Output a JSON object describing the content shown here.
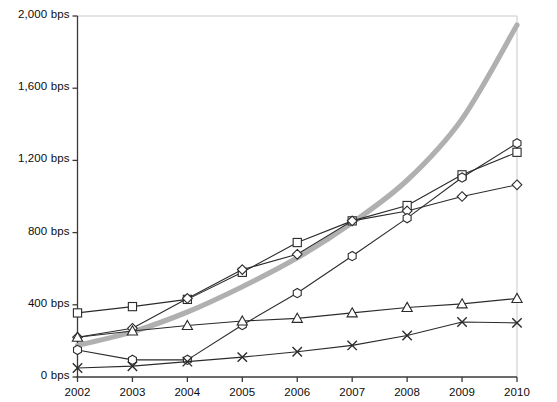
{
  "chart_data": {
    "type": "line",
    "title": "",
    "subtitle": "",
    "xlabel": "",
    "ylabel": "",
    "x": [
      2002,
      2003,
      2004,
      2005,
      2006,
      2007,
      2008,
      2009,
      2010
    ],
    "xtick_labels": [
      "2002",
      "2003",
      "2004",
      "2005",
      "2006",
      "2007",
      "2008",
      "2009",
      "2010"
    ],
    "ytick_labels": [
      "0 bps",
      "400 bps",
      "800 bps",
      "1,200 bps",
      "1,600 bps",
      "2,000 bps"
    ],
    "ytick_values": [
      0,
      400,
      800,
      1200,
      1600,
      2000
    ],
    "ylim": [
      0,
      2000
    ],
    "xlim": [
      2002,
      2010
    ],
    "yunit": "bps",
    "grid": false,
    "legend": "none",
    "axis_color": "#3a3a3a",
    "plot_background": "#ffffff",
    "series": [
      {
        "name": "series-square",
        "marker": "square",
        "color": "#2b2b2b",
        "line_width": 1.1,
        "values": [
          355,
          390,
          430,
          580,
          745,
          865,
          950,
          1120,
          1245
        ]
      },
      {
        "name": "series-diamond",
        "marker": "diamond",
        "color": "#2b2b2b",
        "line_width": 1.1,
        "values": [
          220,
          270,
          435,
          595,
          680,
          865,
          920,
          1000,
          1065
        ]
      },
      {
        "name": "series-hexagon",
        "marker": "hexagon",
        "color": "#2b2b2b",
        "line_width": 1.1,
        "values": [
          150,
          95,
          95,
          288,
          465,
          670,
          880,
          1105,
          1295
        ]
      },
      {
        "name": "series-triangle",
        "marker": "triangle",
        "color": "#2b2b2b",
        "line_width": 1.1,
        "values": [
          220,
          255,
          285,
          310,
          325,
          355,
          385,
          405,
          435
        ]
      },
      {
        "name": "series-cross",
        "marker": "cross",
        "color": "#2b2b2b",
        "line_width": 1.1,
        "values": [
          50,
          60,
          85,
          110,
          140,
          175,
          230,
          305,
          300
        ]
      },
      {
        "name": "series-thick-gray",
        "marker": "none",
        "color": "#b0b0b0",
        "line_width": 5.2,
        "smooth": true,
        "values": [
          175,
          250,
          360,
          500,
          660,
          855,
          1090,
          1430,
          1950
        ]
      }
    ]
  },
  "axes": {
    "y_axis_name": "y-axis",
    "x_axis_name": "x-axis"
  }
}
